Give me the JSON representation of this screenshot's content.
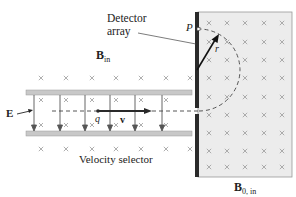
{
  "labels": {
    "detector_line1": "Detector",
    "detector_line2": "array",
    "point_p": "P",
    "radius": "r",
    "b_in_main": "B",
    "b_in_sub": "in",
    "e_field": "E",
    "charge": "q",
    "velocity": "v",
    "velocity_selector": "Velocity selector",
    "b0_main": "B",
    "b0_sub": "0, in"
  },
  "colors": {
    "plate": "#c8c8c8",
    "plate_border": "#9a9a9a",
    "detector": "#2a2a2a",
    "field_region": "#ececec",
    "field_border": "#9a9a9a",
    "cross": "#9a9a9a",
    "arrow": "#555555",
    "particle": "#2a2a2a"
  },
  "geometry": {
    "upper_plate_y": 90,
    "lower_plate_y": 131,
    "plate_x_start": 26,
    "plate_x_end": 192,
    "beam_y": 111,
    "e_arrows_x": [
      34,
      60,
      85,
      110,
      135,
      162
    ],
    "detector_x": 196,
    "field_region": {
      "x": 198,
      "y": 12,
      "w": 94,
      "h": 165
    },
    "semicircle": {
      "cx": 199,
      "cy": 70,
      "r": 41
    }
  }
}
